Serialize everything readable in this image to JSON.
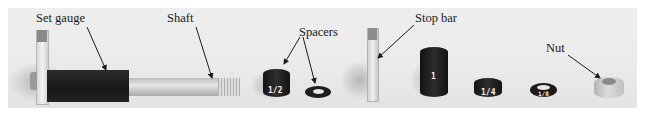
{
  "labels": {
    "set_gauge": "Set gauge",
    "shaft": "Shaft",
    "spacers": "Spacers",
    "stop_bar": "Stop bar",
    "nut": "Nut"
  },
  "spacer_markings": {
    "half": "1/2",
    "one": "1",
    "quarter": "1/4",
    "eighth": "1/8"
  },
  "colors": {
    "background": "#ebebeb",
    "dark_part": "#1e1e1e",
    "metal": "#c8c8c8"
  }
}
